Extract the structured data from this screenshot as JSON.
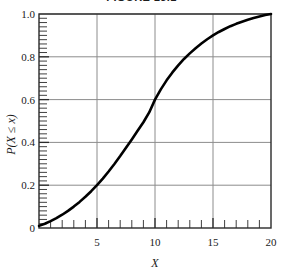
{
  "figure": {
    "title": "FIGURE 13.1"
  },
  "chart_data": {
    "type": "line",
    "title": "FIGURE 13.1",
    "xlabel": "X",
    "ylabel": "P(X ≤ x)",
    "xlim": [
      0,
      20
    ],
    "ylim": [
      0,
      1.0
    ],
    "grid": true,
    "legend": null,
    "x_ticks": [
      5,
      10,
      15,
      20
    ],
    "x_tick_labels": [
      "5",
      "10",
      "15",
      "20"
    ],
    "x_minor_tick_step": 1,
    "y_ticks": [
      0,
      0.2,
      0.4,
      0.6,
      0.8,
      1.0
    ],
    "y_tick_labels": [
      "0",
      "0.2",
      "0.4",
      "0.6",
      "0.8",
      "1.0"
    ],
    "y_minor_tick_step": 0.02,
    "series": [
      {
        "name": "P(X ≤ x)",
        "color": "#000000",
        "line_width": 2.6,
        "x": [
          0,
          0.5,
          1,
          1.5,
          2,
          2.5,
          3,
          3.5,
          4,
          4.5,
          5,
          5.5,
          6,
          6.5,
          7,
          7.5,
          8,
          8.5,
          9,
          9.5,
          10,
          10.5,
          11,
          11.5,
          12,
          12.5,
          13,
          13.5,
          14,
          14.5,
          15,
          15.5,
          16,
          16.5,
          17,
          17.5,
          18,
          18.5,
          19,
          19.5,
          20
        ],
        "y": [
          0.01,
          0.02,
          0.032,
          0.046,
          0.062,
          0.08,
          0.1,
          0.122,
          0.146,
          0.172,
          0.2,
          0.231,
          0.264,
          0.299,
          0.336,
          0.375,
          0.414,
          0.454,
          0.494,
          0.54,
          0.6,
          0.648,
          0.69,
          0.727,
          0.76,
          0.79,
          0.816,
          0.84,
          0.862,
          0.882,
          0.9,
          0.916,
          0.93,
          0.943,
          0.954,
          0.964,
          0.973,
          0.981,
          0.988,
          0.995,
          1.0
        ]
      }
    ],
    "annotations": [
      {
        "label": "median crossing",
        "x": 10,
        "y": 0.6
      },
      {
        "label": "curve start",
        "x": 0,
        "y": 0.01
      },
      {
        "label": "curve end",
        "x": 20,
        "y": 1.0
      }
    ]
  },
  "style": {
    "background": "#ffffff",
    "frame_color": "#2a2a2a",
    "grid_color": "#8c8c8c",
    "curve_color": "#000000",
    "text_color": "#1a1a1a"
  },
  "geometry": {
    "plot_left": 39,
    "plot_right": 271,
    "plot_top": 14,
    "plot_bottom": 228
  }
}
